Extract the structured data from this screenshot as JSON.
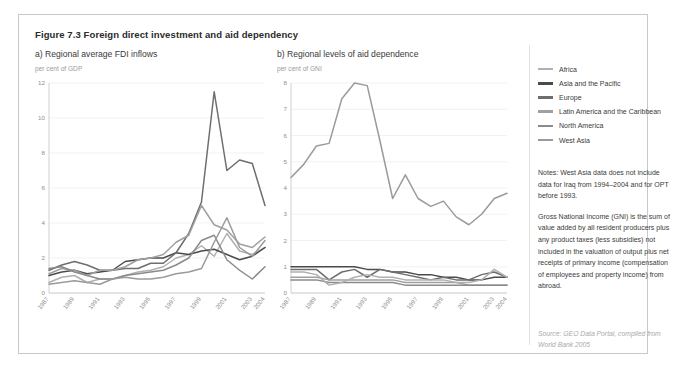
{
  "figure": {
    "title": "Figure 7.3 Foreign direct investment and aid dependency"
  },
  "panel_a": {
    "title": "a) Regional average FDI inflows",
    "unit": "per cent of GDP"
  },
  "panel_b": {
    "title": "b) Regional levels of aid dependence",
    "unit": "per cent of GNI"
  },
  "legend": {
    "items": [
      {
        "label": "Africa",
        "color": "#b0b0b0"
      },
      {
        "label": "Asia and the Pacific",
        "color": "#4a4a4a"
      },
      {
        "label": "Europe",
        "color": "#6e6e6e"
      },
      {
        "label": "Latin America and the Caribbean",
        "color": "#a0a0a0"
      },
      {
        "label": "North America",
        "color": "#8a8a8a"
      },
      {
        "label": "West Asia",
        "color": "#9a9a9a"
      }
    ]
  },
  "notes": {
    "paragraphs": [
      "Notes: West Asia data does not include data for Iraq from 1994–2004 and for OPT before 1993.",
      "Gross National Income (GNI) is the sum of value added by all resident producers plus any product taxes (less subsidies) not included in the valuation of output plus net receipts of primary income (compensation of employees and property income) from abroad."
    ]
  },
  "source": {
    "text": "Source: GEO Data Portal, compiled from World Bank 2005"
  },
  "chart_data": [
    {
      "type": "line",
      "title": "a) Regional average FDI inflows",
      "xlabel": "",
      "ylabel": "per cent of GDP",
      "ylim": [
        0,
        12
      ],
      "yticks": [
        0,
        2,
        4,
        6,
        8,
        10,
        12
      ],
      "grid": true,
      "legend_position": "right",
      "x": [
        1987,
        1988,
        1989,
        1990,
        1991,
        1992,
        1993,
        1994,
        1995,
        1996,
        1997,
        1998,
        1999,
        2000,
        2001,
        2002,
        2003,
        2004
      ],
      "xtick_labels": [
        "1987",
        "1989",
        "1991",
        "1993",
        "1995",
        "1997",
        "1999",
        "2001",
        "2003",
        "2004"
      ],
      "series": [
        {
          "name": "Africa",
          "color": "#b0b0b0",
          "values": [
            0.6,
            0.9,
            1.0,
            0.6,
            0.8,
            0.8,
            1.0,
            1.2,
            1.3,
            1.5,
            2.0,
            2.2,
            2.7,
            2.1,
            3.4,
            2.4,
            2.2,
            2.6
          ]
        },
        {
          "name": "Asia and the Pacific",
          "color": "#4a4a4a",
          "values": [
            1.0,
            1.2,
            1.3,
            1.1,
            1.2,
            1.3,
            1.8,
            1.9,
            2.0,
            2.0,
            2.3,
            2.2,
            2.4,
            2.5,
            2.2,
            1.9,
            2.1,
            2.6
          ]
        },
        {
          "name": "Europe",
          "color": "#6e6e6e",
          "values": [
            1.3,
            1.6,
            1.8,
            1.6,
            1.3,
            1.3,
            1.4,
            1.4,
            1.7,
            1.7,
            2.3,
            3.4,
            5.2,
            11.5,
            7.0,
            7.6,
            7.4,
            5.0
          ]
        },
        {
          "name": "Latin America and the Caribbean",
          "color": "#a0a0a0",
          "values": [
            1.1,
            1.4,
            1.3,
            1.0,
            1.3,
            1.3,
            1.5,
            1.9,
            2.0,
            2.2,
            2.9,
            3.3,
            5.0,
            3.9,
            3.6,
            2.8,
            2.6,
            3.2
          ]
        },
        {
          "name": "North America",
          "color": "#8a8a8a",
          "values": [
            1.4,
            1.5,
            1.2,
            1.0,
            0.8,
            0.8,
            1.0,
            1.1,
            1.2,
            1.3,
            1.6,
            2.0,
            3.0,
            3.3,
            1.9,
            1.3,
            0.8,
            1.5
          ]
        },
        {
          "name": "West Asia",
          "color": "#9a9a9a",
          "values": [
            0.5,
            0.6,
            0.7,
            0.6,
            0.5,
            0.8,
            0.9,
            0.8,
            0.8,
            0.9,
            1.1,
            1.2,
            1.4,
            2.9,
            4.3,
            2.6,
            2.1,
            3.0
          ]
        }
      ]
    },
    {
      "type": "line",
      "title": "b) Regional levels of aid dependence",
      "xlabel": "",
      "ylabel": "per cent of GNI",
      "ylim": [
        0,
        8
      ],
      "yticks": [
        0,
        1,
        2,
        3,
        4,
        5,
        6,
        7,
        8
      ],
      "grid": true,
      "legend_position": "right",
      "x": [
        1987,
        1988,
        1989,
        1990,
        1991,
        1992,
        1993,
        1994,
        1995,
        1996,
        1997,
        1998,
        1999,
        2000,
        2001,
        2002,
        2003,
        2004
      ],
      "xtick_labels": [
        "1987",
        "1989",
        "1991",
        "1993",
        "1995",
        "1997",
        "1999",
        "2001",
        "2003",
        "2004"
      ],
      "series": [
        {
          "name": "Africa",
          "color": "#9a9a9a",
          "values": [
            4.4,
            4.9,
            5.6,
            5.7,
            7.4,
            8.0,
            7.9,
            5.8,
            3.6,
            4.5,
            3.6,
            3.3,
            3.5,
            2.9,
            2.6,
            3.0,
            3.6,
            3.8
          ]
        },
        {
          "name": "Asia and the Pacific",
          "color": "#4a4a4a",
          "values": [
            1.0,
            1.0,
            1.0,
            1.0,
            1.0,
            1.0,
            0.9,
            0.9,
            0.8,
            0.8,
            0.7,
            0.7,
            0.6,
            0.6,
            0.5,
            0.5,
            0.6,
            0.6
          ]
        },
        {
          "name": "Europe",
          "color": "#6e6e6e",
          "values": [
            0.9,
            0.9,
            0.9,
            0.5,
            0.8,
            0.9,
            0.6,
            0.9,
            0.8,
            0.7,
            0.6,
            0.5,
            0.6,
            0.5,
            0.5,
            0.7,
            0.8,
            0.6
          ]
        },
        {
          "name": "Latin America and the Caribbean",
          "color": "#a0a0a0",
          "values": [
            0.6,
            0.6,
            0.6,
            0.5,
            0.5,
            0.5,
            0.5,
            0.5,
            0.5,
            0.4,
            0.4,
            0.4,
            0.4,
            0.4,
            0.3,
            0.3,
            0.3,
            0.3
          ]
        },
        {
          "name": "North America",
          "color": "#8a8a8a",
          "values": [
            0.5,
            0.5,
            0.5,
            0.4,
            0.4,
            0.4,
            0.4,
            0.4,
            0.4,
            0.3,
            0.3,
            0.3,
            0.3,
            0.3,
            0.3,
            0.3,
            0.3,
            0.3
          ]
        },
        {
          "name": "West Asia",
          "color": "#b0b0b0",
          "values": [
            0.8,
            0.8,
            0.7,
            0.3,
            0.4,
            0.6,
            0.7,
            0.6,
            0.6,
            0.5,
            0.5,
            0.5,
            0.5,
            0.4,
            0.4,
            0.5,
            0.9,
            0.6
          ]
        }
      ]
    }
  ]
}
